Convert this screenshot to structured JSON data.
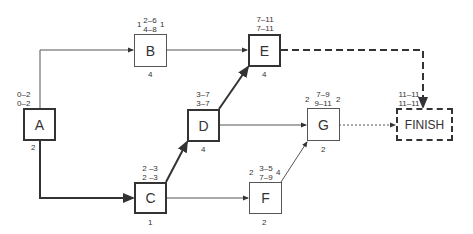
{
  "diagram": {
    "type": "critical-path-network",
    "nodes": {
      "A": {
        "label": "A",
        "es_ef": "0–2",
        "ls_lf": "0–2",
        "duration": "2",
        "critical": true
      },
      "B": {
        "label": "B",
        "es_ef": "2–6",
        "ls_lf": "4–8",
        "slack_left": "1",
        "slack_right": "1",
        "duration": "4",
        "critical": false
      },
      "C": {
        "label": "C",
        "es_ef": "2 –3",
        "ls_lf": "2 –3",
        "duration": "1",
        "critical": true
      },
      "D": {
        "label": "D",
        "es_ef": "3–7",
        "ls_lf": "3–7",
        "duration": "4",
        "critical": true
      },
      "E": {
        "label": "E",
        "es_ef": "7–11",
        "ls_lf": "7–11",
        "duration": "4",
        "critical": true
      },
      "F": {
        "label": "F",
        "es_ef": "3–5",
        "ls_lf": "7–9",
        "slack_left": "2",
        "slack_right": "4",
        "duration": "2",
        "critical": false
      },
      "G": {
        "label": "G",
        "es_ef": "7–9",
        "ls_lf": "9–11",
        "slack_left": "2",
        "slack_right": "2",
        "duration": "2",
        "critical": false
      },
      "FINISH": {
        "label": "FINISH",
        "es_ef": "11–11",
        "ls_lf": "11–11",
        "critical": true
      }
    },
    "edges": [
      {
        "from": "A",
        "to": "B",
        "critical": false
      },
      {
        "from": "A",
        "to": "C",
        "critical": true
      },
      {
        "from": "B",
        "to": "E",
        "critical": false
      },
      {
        "from": "C",
        "to": "D",
        "critical": true
      },
      {
        "from": "C",
        "to": "F",
        "critical": false
      },
      {
        "from": "D",
        "to": "E",
        "critical": true
      },
      {
        "from": "D",
        "to": "G",
        "critical": false
      },
      {
        "from": "F",
        "to": "G",
        "critical": false
      },
      {
        "from": "E",
        "to": "FINISH",
        "critical": true,
        "style": "dashed"
      },
      {
        "from": "G",
        "to": "FINISH",
        "critical": false,
        "style": "dotted"
      }
    ]
  }
}
